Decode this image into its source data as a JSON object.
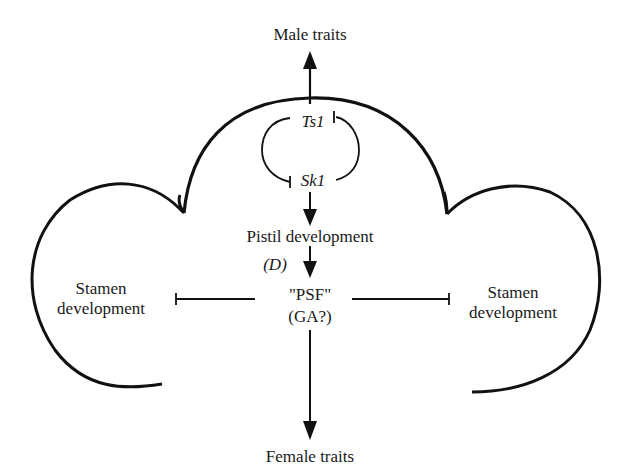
{
  "diagram": {
    "type": "regulatory-pathway",
    "nodes": {
      "male_traits": "Male traits",
      "ts1": "Ts1",
      "sk1": "Sk1",
      "pistil_development": "Pistil development",
      "d_gene": "(D)",
      "psf_line1": "\"PSF\"",
      "psf_line2": "(GA?)",
      "stamen_left_line1": "Stamen",
      "stamen_left_line2": "development",
      "stamen_right_line1": "Stamen",
      "stamen_right_line2": "development",
      "female_traits": "Female traits"
    },
    "edges": [
      {
        "from": "Ts1",
        "to": "Male traits",
        "kind": "activation"
      },
      {
        "from": "Ts1",
        "to": "Sk1",
        "kind": "inhibition"
      },
      {
        "from": "Sk1",
        "to": "Ts1",
        "kind": "inhibition"
      },
      {
        "from": "Sk1",
        "to": "Pistil development",
        "kind": "activation"
      },
      {
        "from": "Pistil development",
        "to": "\"PSF\" (GA?)",
        "kind": "activation",
        "label": "(D)"
      },
      {
        "from": "\"PSF\" (GA?)",
        "to": "Stamen development (left)",
        "kind": "inhibition"
      },
      {
        "from": "\"PSF\" (GA?)",
        "to": "Stamen development (right)",
        "kind": "inhibition"
      },
      {
        "from": "\"PSF\" (GA?)",
        "to": "Female traits",
        "kind": "activation"
      }
    ],
    "colors": {
      "ink": "#111111",
      "background": "#ffffff"
    }
  }
}
